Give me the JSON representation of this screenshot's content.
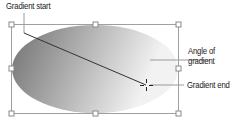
{
  "diagram": {
    "labels": {
      "gradient_start": "Gradient start",
      "angle_line1": "Angle of",
      "angle_line2": "gradient",
      "gradient_end": "Gradient end"
    },
    "shape": {
      "type": "ellipse",
      "fill_start_color": "#7d7d7d",
      "fill_end_color": "#f2f2f2",
      "bounding_box": {
        "x": 11,
        "y": 24,
        "width": 167,
        "height": 89
      }
    },
    "gradient_line": {
      "start": [
        24,
        33
      ],
      "end": [
        146,
        85
      ]
    },
    "colors": {
      "leader_line": "#9a9a9a",
      "handle_border": "#8a8a8a",
      "gradient_line": "#333333"
    }
  }
}
